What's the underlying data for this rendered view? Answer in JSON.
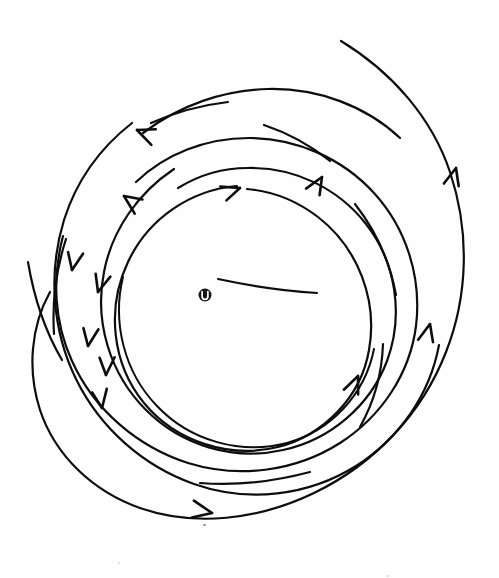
{
  "figure": {
    "background_color": "#fefefe",
    "ink_color": "#0d0d0d",
    "width": 499,
    "height": 578,
    "style": "hand-drawn line sketch",
    "flow_direction": "counterclockwise"
  },
  "center_marker": {
    "name": "omega-center-marker",
    "label": "U",
    "cx": 205,
    "cy": 295,
    "outer_radius": 6.5,
    "ring_color": "#141414",
    "glyph_color": "#ffffff"
  },
  "arms": [
    {
      "id": "arm-outer",
      "name": "outermost-spiral-arm",
      "description": "Longest outer arm, free end at upper right, sweeping counterclockwise around to lower left",
      "stroke_width": 2.2,
      "start_point": [
        341,
        41
      ],
      "end_point": [
        86,
        450
      ],
      "arrow_count": 3
    },
    {
      "id": "arm-second",
      "name": "second-spiral-arm",
      "description": "Second arm, free end upper-left, sweeping down the left and around the bottom to the right",
      "stroke_width": 2.2,
      "start_point": [
        132,
        123
      ],
      "end_point": [
        392,
        441
      ],
      "arrow_count": 3
    },
    {
      "id": "arm-third",
      "name": "third-spiral-arm",
      "description": "Third arm wrapping the mid radius",
      "stroke_width": 2.2,
      "start_point": [
        63,
        236
      ],
      "end_point": [
        356,
        468
      ],
      "arrow_count": 3
    },
    {
      "id": "arm-fourth",
      "name": "fourth-spiral-arm",
      "description": "Inner-mid arm forming the near-circular loop",
      "stroke_width": 2.2,
      "start_point": [
        174,
        169
      ],
      "end_point": [
        313,
        403
      ],
      "arrow_count": 2
    },
    {
      "id": "arm-inner",
      "name": "innermost-circle-arm",
      "description": "Innermost nearly closed circle around the center marker",
      "stroke_width": 2.2,
      "start_point": [
        237,
        186
      ],
      "end_point": [
        247,
        189
      ],
      "arrow_count": 1
    }
  ],
  "dashes": [
    {
      "id": "dash-top-left",
      "name": "dash-segment-top-left",
      "stroke_width": 2.2
    },
    {
      "id": "dash-top-right",
      "name": "dash-segment-top-right",
      "stroke_width": 2.2
    },
    {
      "id": "dash-right-mid",
      "name": "dash-segment-right-mid",
      "stroke_width": 2.2
    },
    {
      "id": "dash-right-low",
      "name": "dash-segment-right-lower",
      "stroke_width": 2.2
    },
    {
      "id": "dash-bottom",
      "name": "dash-segment-bottom",
      "stroke_width": 2.2
    },
    {
      "id": "dash-left",
      "name": "dash-segment-left",
      "stroke_width": 2.2
    }
  ],
  "arrowheads": [
    {
      "id": "ah-1",
      "name": "arrowhead-top-outer-left",
      "x": 137,
      "y": 130,
      "angle": 203
    },
    {
      "id": "ah-2",
      "name": "arrowhead-top-second-left",
      "x": 124,
      "y": 196,
      "angle": 216
    },
    {
      "id": "ah-3",
      "name": "arrowhead-top-inner-right",
      "x": 322,
      "y": 177,
      "angle": 300
    },
    {
      "id": "ah-4",
      "name": "arrowhead-inner-circle-top",
      "x": 240,
      "y": 188,
      "angle": 340
    },
    {
      "id": "ah-5",
      "name": "arrowhead-left-upper",
      "x": 72,
      "y": 270,
      "angle": 100
    },
    {
      "id": "ah-6",
      "name": "arrowhead-left-mid",
      "x": 98,
      "y": 292,
      "angle": 105
    },
    {
      "id": "ah-7",
      "name": "arrowhead-left-lower",
      "x": 88,
      "y": 346,
      "angle": 98
    },
    {
      "id": "ah-8",
      "name": "arrowhead-left-lowest",
      "x": 106,
      "y": 375,
      "angle": 92
    },
    {
      "id": "ah-9",
      "name": "arrowhead-left-bottom",
      "x": 102,
      "y": 408,
      "angle": 80
    },
    {
      "id": "ah-10",
      "name": "arrowhead-right-upper",
      "x": 456,
      "y": 168,
      "angle": 284
    },
    {
      "id": "ah-11",
      "name": "arrowhead-right-mid",
      "x": 430,
      "y": 324,
      "angle": 283
    },
    {
      "id": "ah-12",
      "name": "arrowhead-right-inner",
      "x": 358,
      "y": 376,
      "angle": 292
    },
    {
      "id": "ah-13",
      "name": "arrowhead-bottom",
      "x": 212,
      "y": 513,
      "angle": 10
    }
  ]
}
